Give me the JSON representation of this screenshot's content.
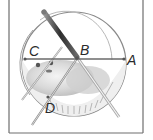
{
  "figure": {
    "frame_color": "#6e6e6e",
    "line_color": "#6a6a6a",
    "bar_color": "#3a3a3a"
  },
  "points": {
    "A": {
      "label": "A",
      "x": 124,
      "y": 59
    },
    "B": {
      "label": "B",
      "x": 77,
      "y": 58
    },
    "C": {
      "label": "C",
      "x": 25,
      "y": 59
    },
    "D": {
      "label": "D",
      "x": 48,
      "y": 97
    }
  },
  "labels": [
    {
      "text": "C",
      "x": 29,
      "y": 44
    },
    {
      "text": "B",
      "x": 80,
      "y": 43
    },
    {
      "text": "A",
      "x": 127,
      "y": 53
    },
    {
      "text": "D",
      "x": 45,
      "y": 101
    }
  ]
}
